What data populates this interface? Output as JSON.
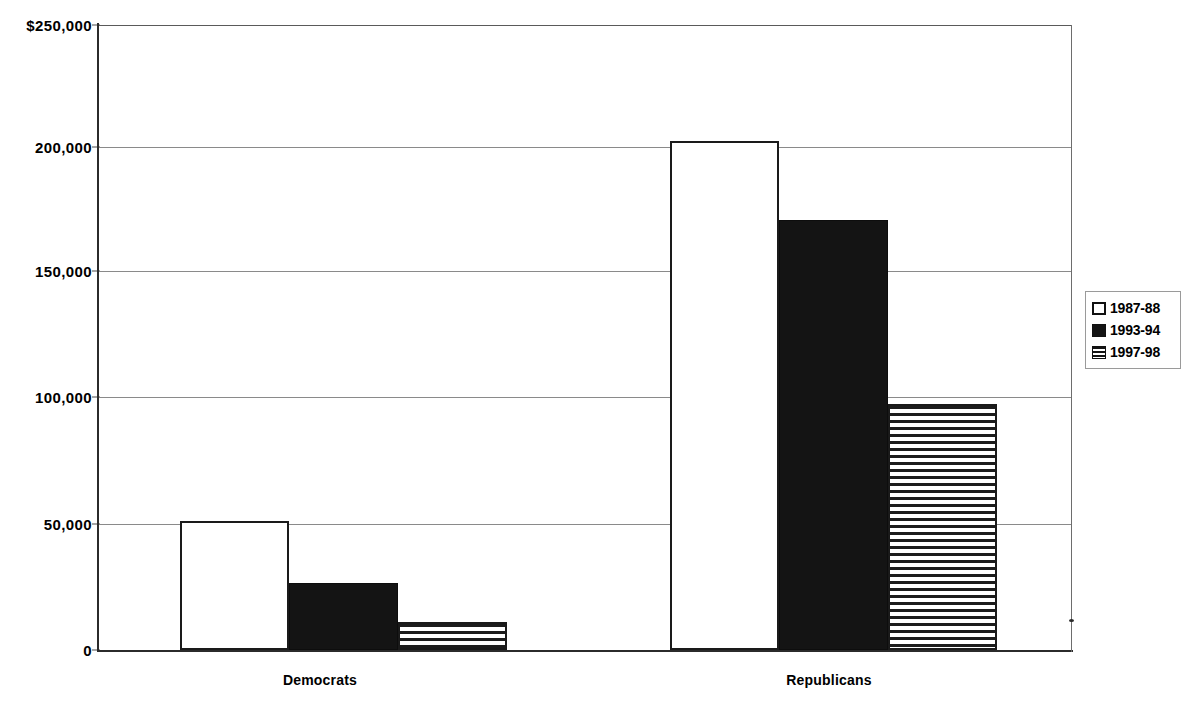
{
  "chart_data": {
    "type": "bar",
    "title": "",
    "subtitle": "",
    "xlabel": "",
    "ylabel": "",
    "categories": [
      "Democrats",
      "Republicans"
    ],
    "series": [
      {
        "name": "1987-88",
        "fill": "empty",
        "values": [
          51600,
          203500
        ]
      },
      {
        "name": "1993-94",
        "fill": "solid",
        "values": [
          26800,
          172000
        ]
      },
      {
        "name": "1997-98",
        "fill": "hstripe",
        "values": [
          11200,
          98500
        ]
      }
    ],
    "ylim": [
      0,
      250000
    ],
    "y_ticks": [
      {
        "value": 250000,
        "label": "$250,000"
      },
      {
        "value": 200000,
        "label": "200,000"
      },
      {
        "value": 150000,
        "label": "150,000"
      },
      {
        "value": 100000,
        "label": "100,000"
      },
      {
        "value": 50000,
        "label": "50,000"
      },
      {
        "value": 0,
        "label": "0"
      }
    ],
    "grid": true,
    "legend_position": "right",
    "currency_symbol": "$"
  },
  "axis": {
    "y_tick_250": "$250,000",
    "y_tick_200": "200,000",
    "y_tick_150": "150,000",
    "y_tick_100": "100,000",
    "y_tick_50": "50,000",
    "y_tick_0": "0"
  },
  "categories": {
    "democrats": "Democrats",
    "republicans": "Republicans"
  },
  "legend": {
    "items": [
      {
        "label": "1987-88"
      },
      {
        "label": "1993-94"
      },
      {
        "label": "1997-98"
      }
    ]
  },
  "colors": {
    "axis": "#2b2b2b",
    "gridline": "#8a8a8a",
    "bar_solid": "#141414",
    "bar_outline": "#1a1a1a",
    "background": "#ffffff"
  }
}
